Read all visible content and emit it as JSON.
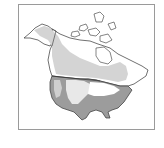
{
  "map": {
    "subject": "North America range map",
    "regions": [
      {
        "name": "canada-alaska-range",
        "shade": "light",
        "color": "#d4d4d4"
      },
      {
        "name": "us-range",
        "shade": "dark",
        "color": "#9c9c9c"
      },
      {
        "name": "great-plains-light",
        "shade": "light",
        "color": "#dcdcdc"
      }
    ],
    "colors": {
      "land": "#ffffff",
      "outline": "#333333",
      "light_range": "#d4d4d4",
      "dark_range": "#9c9c9c",
      "frame": "#9a9a9a"
    }
  }
}
